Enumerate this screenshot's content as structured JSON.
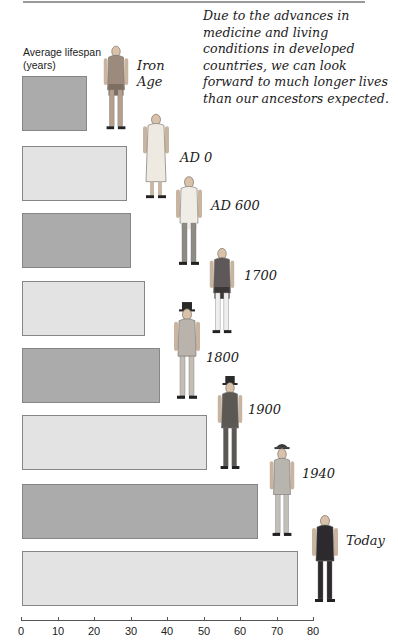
{
  "caption": "Due to the advances in medicine and living conditions in developed countries, we can look forward to much longer lives than our ancestors expected.",
  "y_axis_label": "Average lifespan (years)",
  "colors": {
    "bar_dark": "#ababab",
    "bar_light": "#e3e3e3",
    "bar_border": "#868686",
    "axis": "#555555"
  },
  "chart_data": {
    "type": "bar",
    "orientation": "horizontal",
    "title": "",
    "xlabel": "",
    "ylabel": "Average lifespan (years)",
    "categories": [
      "Iron Age",
      "AD 0",
      "AD 600",
      "1700",
      "1800",
      "1900",
      "1940",
      "Today"
    ],
    "values": [
      18,
      29,
      30,
      34,
      38,
      51,
      65,
      76
    ],
    "xlim": [
      0,
      80
    ],
    "x_ticks": [
      "0",
      "10",
      "20",
      "30",
      "40",
      "50",
      "60",
      "70",
      "80"
    ],
    "grid": false,
    "legend": null,
    "annotations": [
      "Due to the advances in medicine and living conditions in developed countries, we can look forward to much longer lives than our ancestors expected."
    ]
  },
  "eras": [
    {
      "label": "Iron Age",
      "label_lines": [
        "Iron",
        "Age"
      ],
      "figure": "iron-age-man-figure"
    },
    {
      "label": "AD 0",
      "figure": "roman-toga-figure"
    },
    {
      "label": "AD 600",
      "figure": "tunic-figure"
    },
    {
      "label": "1700",
      "figure": "coat-breeches-figure"
    },
    {
      "label": "1800",
      "figure": "top-hat-suit-figure"
    },
    {
      "label": "1900",
      "figure": "bowler-hat-suit-figure"
    },
    {
      "label": "1940",
      "figure": "fedora-suit-figure"
    },
    {
      "label": "Today",
      "figure": "modern-suit-figure"
    }
  ]
}
